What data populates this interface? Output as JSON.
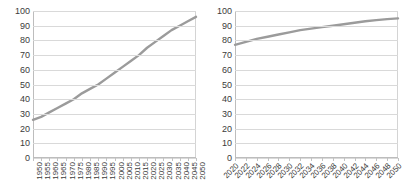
{
  "chart_data": [
    {
      "id": "left",
      "type": "line",
      "title": "",
      "xlabel": "",
      "ylabel": "",
      "ylim": [
        0,
        100
      ],
      "ytick_step": 10,
      "yticks": [
        0,
        10,
        20,
        30,
        40,
        50,
        60,
        70,
        80,
        90,
        100
      ],
      "grid": true,
      "legend": "none",
      "label_rotation": 90,
      "line_color": "#9b9b9b",
      "grid_color": "#d9d9d9",
      "categories": [
        "1950",
        "1955",
        "1960",
        "1965",
        "1970",
        "1975",
        "1980",
        "1985",
        "1990",
        "1995",
        "2000",
        "2005",
        "2010",
        "2015",
        "2020",
        "2025",
        "2030",
        "2035",
        "2040",
        "2045",
        "2050"
      ],
      "values": [
        26,
        28,
        31,
        34,
        37,
        40,
        44,
        47,
        50,
        54,
        58,
        62,
        66,
        70,
        75,
        79,
        83,
        87,
        90,
        93,
        96
      ]
    },
    {
      "id": "right",
      "type": "line",
      "title": "",
      "xlabel": "",
      "ylabel": "",
      "ylim": [
        0,
        100
      ],
      "ytick_step": 10,
      "yticks": [
        0,
        10,
        20,
        30,
        40,
        50,
        60,
        70,
        80,
        90,
        100
      ],
      "grid": true,
      "legend": "none",
      "label_rotation": 45,
      "line_color": "#9b9b9b",
      "grid_color": "#d9d9d9",
      "categories": [
        "2020",
        "2022",
        "2024",
        "2026",
        "2028",
        "2030",
        "2032",
        "2034",
        "2036",
        "2038",
        "2040",
        "2042",
        "2044",
        "2046",
        "2048",
        "2050"
      ],
      "values": [
        77,
        79,
        81,
        82.5,
        84,
        85.5,
        87,
        88,
        89,
        90,
        91,
        92,
        93,
        93.8,
        94.5,
        95
      ]
    }
  ]
}
